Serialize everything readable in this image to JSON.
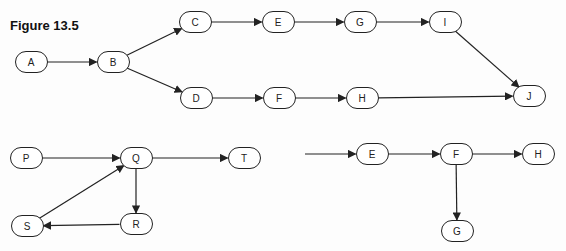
{
  "figure": {
    "title": "Figure 13.5"
  },
  "graphs": [
    {
      "id": "top",
      "nodes": [
        {
          "id": "A",
          "label": "A",
          "x": 31,
          "y": 62
        },
        {
          "id": "B",
          "label": "B",
          "x": 113,
          "y": 62
        },
        {
          "id": "C",
          "label": "C",
          "x": 195,
          "y": 22
        },
        {
          "id": "E",
          "label": "E",
          "x": 278,
          "y": 22
        },
        {
          "id": "G",
          "label": "G",
          "x": 360,
          "y": 22
        },
        {
          "id": "I",
          "label": "I",
          "x": 445,
          "y": 22
        },
        {
          "id": "D",
          "label": "D",
          "x": 196,
          "y": 98
        },
        {
          "id": "F",
          "label": "F",
          "x": 279,
          "y": 98
        },
        {
          "id": "H",
          "label": "H",
          "x": 362,
          "y": 98
        },
        {
          "id": "J",
          "label": "J",
          "x": 529,
          "y": 96
        }
      ],
      "edges": [
        [
          "A",
          "B"
        ],
        [
          "B",
          "C"
        ],
        [
          "B",
          "D"
        ],
        [
          "C",
          "E"
        ],
        [
          "E",
          "G"
        ],
        [
          "G",
          "I"
        ],
        [
          "I",
          "J"
        ],
        [
          "D",
          "F"
        ],
        [
          "F",
          "H"
        ],
        [
          "H",
          "J"
        ]
      ]
    },
    {
      "id": "bottom-left",
      "nodes": [
        {
          "id": "P",
          "label": "P",
          "x": 26,
          "y": 158
        },
        {
          "id": "Q",
          "label": "Q",
          "x": 136,
          "y": 158
        },
        {
          "id": "T",
          "label": "T",
          "x": 244,
          "y": 158
        },
        {
          "id": "R",
          "label": "R",
          "x": 136,
          "y": 224
        },
        {
          "id": "S",
          "label": "S",
          "x": 27,
          "y": 226
        }
      ],
      "edges": [
        [
          "P",
          "Q"
        ],
        [
          "Q",
          "T"
        ],
        [
          "Q",
          "R"
        ],
        [
          "R",
          "S"
        ],
        [
          "S",
          "Q"
        ]
      ]
    },
    {
      "id": "bottom-right",
      "incoming_from": {
        "x": 305,
        "y": 154
      },
      "nodes": [
        {
          "id": "E2",
          "label": "E",
          "x": 372,
          "y": 154
        },
        {
          "id": "F2",
          "label": "F",
          "x": 456,
          "y": 154
        },
        {
          "id": "H2",
          "label": "H",
          "x": 538,
          "y": 154
        },
        {
          "id": "G2",
          "label": "G",
          "x": 457,
          "y": 231
        }
      ],
      "edges": [
        [
          "__in",
          "E2"
        ],
        [
          "E2",
          "F2"
        ],
        [
          "F2",
          "H2"
        ],
        [
          "F2",
          "G2"
        ]
      ]
    }
  ],
  "style": {
    "stroke": "#222222",
    "node_w": 33,
    "node_h": 22
  }
}
